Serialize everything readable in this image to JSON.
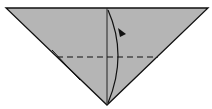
{
  "diagram": {
    "type": "origami-fold-step",
    "paper_color": "#b5b5b5",
    "line_color": "#111111",
    "shape": "inverted-triangle",
    "elements": [
      "center-crease",
      "valley-fold-dashed-line",
      "fold-arrow"
    ]
  }
}
